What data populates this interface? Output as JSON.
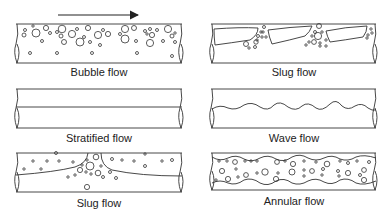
{
  "diagram": {
    "flow_direction": "left-to-right",
    "colors": {
      "line": "#333333",
      "text": "#222222",
      "background": "#ffffff"
    },
    "panels": [
      {
        "id": "bubble",
        "label": "Bubble flow",
        "position": "top-left",
        "has_arrow": true
      },
      {
        "id": "slug-top",
        "label": "Slug flow",
        "position": "top-right"
      },
      {
        "id": "stratified",
        "label": "Stratified flow",
        "position": "middle-left"
      },
      {
        "id": "wave",
        "label": "Wave flow",
        "position": "middle-right"
      },
      {
        "id": "slug-bottom",
        "label": "Slug flow",
        "position": "bottom-left"
      },
      {
        "id": "annular",
        "label": "Annular flow",
        "position": "bottom-right"
      }
    ]
  }
}
